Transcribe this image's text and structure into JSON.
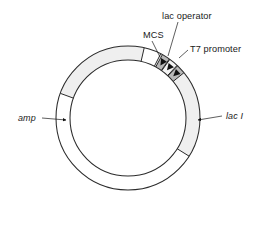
{
  "figure": {
    "type": "plasmid-map",
    "title": "",
    "background_color": "#ffffff",
    "outline_color": "#2b2b2b",
    "text_color": "#1a1a1a"
  },
  "ring": {
    "center_x": 128,
    "center_y": 118,
    "outer_radius": 72,
    "inner_radius": 58,
    "fill": "#ffffff",
    "stroke": "#2b2b2b"
  },
  "features": [
    {
      "id": "amp",
      "label": "amp",
      "italic": true,
      "fill": "#efefef",
      "start_angle": 200,
      "end_angle": 283,
      "label_x": 18,
      "label_y": 118,
      "anchor": "start",
      "arrow_x": 62,
      "arrow_y": 120
    },
    {
      "id": "lac-i",
      "label": "lac I",
      "italic": true,
      "fill": "#efefef",
      "start_angle": 297,
      "end_angle": 32,
      "label_x": 228,
      "label_y": 118,
      "anchor": "start",
      "arrow_x": 194,
      "arrow_y": 120
    },
    {
      "id": "mcs",
      "label": "MCS",
      "italic": false,
      "fill": "#b8b8b8",
      "start_angle": 298.5,
      "end_angle": 305,
      "label_x": 144,
      "label_y": 37,
      "anchor": "start",
      "arrow_x": 159,
      "arrow_y": 61
    },
    {
      "id": "lac-operator",
      "label": "lac operator",
      "italic": false,
      "fill": "#f4f4f4",
      "start_angle": 305.5,
      "end_angle": 313,
      "label_x": 163,
      "label_y": 18,
      "anchor": "start",
      "arrow_x": 169,
      "arrow_y": 58
    },
    {
      "id": "t7-promoter",
      "label": "T7 promoter",
      "italic": false,
      "fill": "#b8b8b8",
      "start_angle": 313.5,
      "end_angle": 321,
      "label_x": 190,
      "label_y": 52,
      "anchor": "start",
      "arrow_x": 181,
      "arrow_y": 61
    }
  ],
  "labels": {
    "amp": "amp",
    "lac_i": "lac I",
    "mcs": "MCS",
    "lac_operator": "lac operator",
    "t7_promoter": "T7 promoter"
  }
}
